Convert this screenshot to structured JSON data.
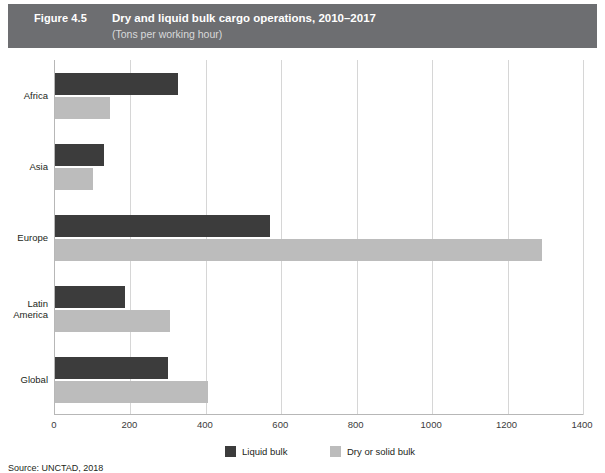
{
  "header": {
    "figure_number": "Figure 4.5",
    "title": "Dry and liquid bulk cargo operations, 2010–2017",
    "subtitle": "(Tons per working hour)",
    "band_color": "#6d6e71"
  },
  "legend": {
    "items": [
      {
        "label": "Liquid bulk",
        "color": "#3c3c3c"
      },
      {
        "label": "Dry or solid bulk",
        "color": "#bcbcbc"
      }
    ]
  },
  "source": {
    "text": "Source: UNCTAD, 2018"
  },
  "chart_data": {
    "type": "bar",
    "orientation": "horizontal",
    "title": "Dry and liquid bulk cargo operations, 2010–2017",
    "subtitle": "(Tons per working hour)",
    "xlabel": "",
    "ylabel": "",
    "xlim": [
      0,
      1400
    ],
    "ylim": null,
    "grid": true,
    "legend_position": "bottom",
    "categories": [
      "Africa",
      "Asia",
      "Europe",
      "Latin America",
      "Global"
    ],
    "category_lines": [
      [
        "Africa"
      ],
      [
        "Asia"
      ],
      [
        "Europe"
      ],
      [
        "Latin",
        "America"
      ],
      [
        "Global"
      ]
    ],
    "xticks": [
      0,
      200,
      400,
      600,
      800,
      1000,
      1200,
      1400
    ],
    "xticklabels": [
      "0",
      "200",
      "400",
      "600",
      "800",
      "1000",
      "1200",
      "1400"
    ],
    "series": [
      {
        "name": "Liquid bulk",
        "color": "#3c3c3c",
        "values": [
          325,
          130,
          570,
          185,
          300
        ]
      },
      {
        "name": "Dry or solid bulk",
        "color": "#bcbcbc",
        "values": [
          145,
          100,
          1290,
          305,
          405
        ]
      }
    ]
  }
}
